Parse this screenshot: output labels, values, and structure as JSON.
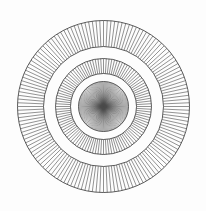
{
  "figure": {
    "width": 206,
    "height": 211,
    "background": "#fdfdfd",
    "line_color": "#4a4a4a",
    "center": {
      "x": 103.5,
      "y": 106.5
    },
    "rings": [
      {
        "name": "outer-ring",
        "inner_radius": 60,
        "outer_radius": 86,
        "spokes": 144
      },
      {
        "name": "middle-ring",
        "inner_radius": 33,
        "outer_radius": 48,
        "spokes": 108
      },
      {
        "name": "inner-disc",
        "inner_radius": 0,
        "outer_radius": 25,
        "spokes": 144
      }
    ]
  }
}
